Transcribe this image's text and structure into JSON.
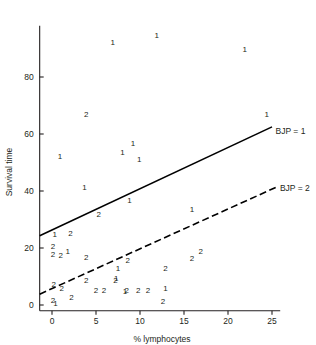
{
  "chart_data": {
    "type": "scatter",
    "title": "",
    "xlabel": "% lymphocytes",
    "ylabel": "Survival time",
    "xlim": [
      -1.4,
      26.5
    ],
    "ylim": [
      -2.0,
      98.0
    ],
    "xticks": [
      0,
      5,
      10,
      15,
      20,
      25
    ],
    "xtick_labels": [
      "0",
      "5",
      "10",
      "15",
      "20",
      "25"
    ],
    "yticks": [
      0,
      20,
      40,
      60,
      80
    ],
    "ytick_labels": [
      "0",
      "20",
      "40",
      "60",
      "80"
    ],
    "grid": false,
    "legend_position": "right-inline",
    "marker_style": "group-number-glyph",
    "series": [
      {
        "name": "BJP = 1",
        "label": "BJP = 1",
        "marker": "1",
        "line_style": "solid",
        "line_color": "#000000",
        "line_endpoints": [
          [
            -1.4,
            24.3
          ],
          [
            25.0,
            62.5
          ]
        ],
        "label_x": 25.4,
        "label_y": 61.2,
        "points": [
          [
            6.9,
            92.0
          ],
          [
            11.9,
            94.5
          ],
          [
            21.9,
            89.5
          ],
          [
            24.4,
            66.5
          ],
          [
            0.9,
            52.0
          ],
          [
            8.0,
            53.5
          ],
          [
            9.2,
            56.5
          ],
          [
            9.9,
            51.0
          ],
          [
            3.7,
            41.0
          ],
          [
            8.8,
            36.5
          ],
          [
            15.9,
            33.5
          ],
          [
            0.3,
            24.5
          ],
          [
            1.8,
            18.5
          ],
          [
            7.5,
            12.5
          ],
          [
            7.3,
            9.0
          ],
          [
            12.9,
            5.5
          ],
          [
            8.3,
            4.5
          ],
          [
            0.4,
            0.5
          ]
        ]
      },
      {
        "name": "BJP = 2",
        "label": "BJP = 2",
        "marker": "2",
        "line_style": "dashed",
        "line_color": "#000000",
        "line_endpoints": [
          [
            -1.4,
            3.8
          ],
          [
            25.6,
            41.5
          ]
        ],
        "label_x": 25.9,
        "label_y": 41.0,
        "points": [
          [
            3.9,
            66.5
          ],
          [
            5.3,
            31.5
          ],
          [
            2.1,
            25.0
          ],
          [
            0.1,
            20.5
          ],
          [
            0.1,
            17.5
          ],
          [
            1.0,
            17.3
          ],
          [
            16.9,
            18.5
          ],
          [
            15.9,
            16.0
          ],
          [
            3.9,
            16.5
          ],
          [
            8.6,
            15.5
          ],
          [
            12.9,
            12.5
          ],
          [
            3.9,
            8.5
          ],
          [
            7.2,
            8.5
          ],
          [
            0.2,
            7.0
          ],
          [
            1.1,
            5.5
          ],
          [
            5.0,
            5.0
          ],
          [
            5.9,
            5.0
          ],
          [
            8.5,
            5.0
          ],
          [
            9.8,
            5.0
          ],
          [
            10.9,
            5.0
          ],
          [
            2.2,
            2.5
          ],
          [
            0.1,
            1.5
          ],
          [
            12.6,
            1.0
          ]
        ]
      }
    ]
  },
  "axes": {
    "x_axis_name": "x-axis",
    "y_axis_name": "y-axis"
  }
}
